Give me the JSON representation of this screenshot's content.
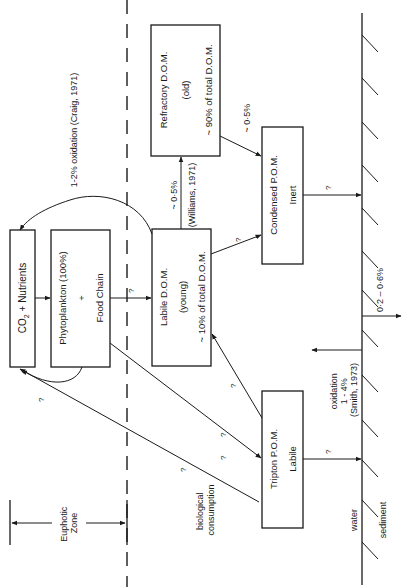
{
  "diagram": {
    "zones": {
      "euphotic_label_1": "Euphotic",
      "euphotic_label_2": "Zone",
      "water_label": "water",
      "sediment_label": "sediment"
    },
    "boxes": {
      "co2": {
        "line1": "CO",
        "sub": "2",
        "line1b": " + Nutrients"
      },
      "phyto": {
        "line1": "Phytoplankton  (100%)",
        "line2": "+",
        "line3": "Food Chain"
      },
      "labile_dom": {
        "line1": "Labile D.O.M.",
        "line2": "(young)",
        "line3": "~ 10% of total D.O.M."
      },
      "refractory_dom": {
        "line1": "Refractory D.O.M.",
        "line2": "(old)",
        "line3": "~ 90% of total D.O.M."
      },
      "condensed_pom": {
        "line1": "Condensed P.O.M.",
        "line2": "Inert"
      },
      "tripton_pom": {
        "line1": "Tripton P.O.M.",
        "line2": "Labile"
      }
    },
    "labels": {
      "craig": "1-2% oxidation (Craig, 1971)",
      "williams_pct": "~ 0·5%",
      "williams_ref": "(Williams, 1971)",
      "refractory_to_condensed": "~ 0·5%",
      "biological_1": "biological",
      "biological_2": "consumption",
      "smith_1": "oxidation",
      "smith_2": "1 - 4%",
      "smith_3": "(Smith, 1973)",
      "burial": "0·2 – 0·6%",
      "unknown": "?"
    },
    "colors": {
      "ink": "#1a1a1a",
      "background": "#ffffff"
    }
  }
}
